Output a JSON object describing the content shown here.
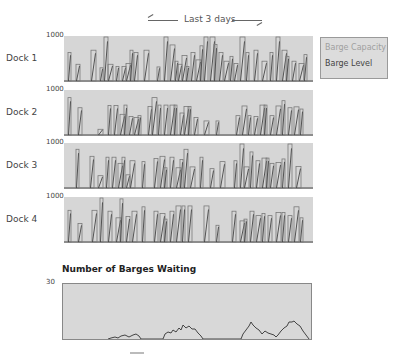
{
  "header": {
    "label": "Last 3 days"
  },
  "legend": {
    "capacity_label": "Barge Capacity",
    "level_label": "Barge Level",
    "capacity_color": "#a0a0a0",
    "level_color": "#444444"
  },
  "docks": [
    {
      "label": "Dock 1",
      "ymax": "1000"
    },
    {
      "label": "Dock 2",
      "ymax": "1000"
    },
    {
      "label": "Dock 3",
      "ymax": "1000"
    },
    {
      "label": "Dock 4",
      "ymax": "1000"
    }
  ],
  "waiting": {
    "title": "Number of Barges Waiting",
    "ymax": "30"
  },
  "chart_data": [
    {
      "type": "bar",
      "title": "Dock 1",
      "subtitle": "Barge Capacity / Barge Level over Last 3 days",
      "ylim": [
        0,
        1000
      ],
      "series": [
        {
          "name": "Barge Capacity",
          "x": [
            4,
            12,
            27,
            36,
            40,
            44,
            52,
            58,
            62,
            66,
            70,
            80,
            93,
            100,
            106,
            111,
            114,
            118,
            122,
            127,
            132,
            136,
            140,
            146,
            150,
            155,
            160,
            166,
            170,
            176,
            182,
            190,
            198,
            206,
            212,
            218,
            222,
            228,
            235,
            240
          ],
          "values": [
            650,
            380,
            700,
            300,
            1000,
            380,
            330,
            330,
            400,
            700,
            650,
            700,
            320,
            1000,
            820,
            450,
            380,
            580,
            330,
            650,
            480,
            800,
            1000,
            1000,
            830,
            650,
            450,
            560,
            400,
            1000,
            650,
            700,
            450,
            650,
            1000,
            700,
            560,
            450,
            400,
            600
          ]
        }
      ]
    },
    {
      "type": "bar",
      "title": "Dock 2",
      "ylim": [
        0,
        1000
      ],
      "series": [
        {
          "name": "Barge Capacity",
          "x": [
            4,
            14,
            34,
            44,
            50,
            56,
            60,
            65,
            70,
            74,
            84,
            88,
            94,
            100,
            106,
            110,
            116,
            120,
            124,
            130,
            140,
            152,
            172,
            178,
            184,
            190,
            196,
            200,
            206,
            212,
            218,
            224,
            230,
            236
          ],
          "values": [
            850,
            620,
            130,
            670,
            670,
            470,
            680,
            420,
            400,
            440,
            650,
            850,
            680,
            680,
            680,
            680,
            500,
            650,
            650,
            400,
            320,
            320,
            440,
            660,
            440,
            420,
            680,
            680,
            440,
            660,
            780,
            620,
            640,
            590
          ]
        }
      ]
    },
    {
      "type": "bar",
      "title": "Dock 3",
      "ylim": [
        0,
        1000
      ],
      "series": [
        {
          "name": "Barge Capacity",
          "x": [
            12,
            26,
            34,
            42,
            48,
            54,
            58,
            62,
            66,
            78,
            90,
            96,
            100,
            106,
            112,
            116,
            120,
            126,
            136,
            146,
            156,
            170,
            176,
            180,
            186,
            192,
            198,
            202,
            206,
            212,
            218,
            224,
            232
          ],
          "values": [
            880,
            720,
            280,
            700,
            700,
            560,
            700,
            300,
            620,
            600,
            670,
            720,
            460,
            700,
            460,
            650,
            880,
            480,
            700,
            440,
            600,
            620,
            1000,
            480,
            820,
            620,
            680,
            680,
            560,
            580,
            660,
            1000,
            490
          ]
        }
      ]
    },
    {
      "type": "bar",
      "title": "Dock 4",
      "ylim": [
        0,
        1000
      ],
      "series": [
        {
          "name": "Barge Capacity",
          "x": [
            4,
            14,
            28,
            36,
            44,
            52,
            56,
            62,
            68,
            78,
            90,
            96,
            100,
            106,
            112,
            118,
            124,
            140,
            152,
            168,
            176,
            180,
            186,
            192,
            198,
            204,
            212,
            218,
            224,
            230,
            236
          ],
          "values": [
            720,
            420,
            720,
            1000,
            700,
            550,
            980,
            580,
            700,
            800,
            700,
            650,
            520,
            700,
            820,
            820,
            820,
            820,
            380,
            700,
            480,
            520,
            700,
            600,
            650,
            600,
            670,
            670,
            600,
            800,
            550
          ]
        }
      ]
    },
    {
      "type": "line",
      "title": "Number of Barges Waiting",
      "ylim": [
        0,
        30
      ],
      "x": [
        0,
        10,
        20,
        30,
        40,
        45,
        50,
        55,
        60,
        70,
        72,
        74,
        76,
        78,
        80,
        85,
        90,
        95,
        100,
        105,
        108,
        110,
        120,
        140,
        160,
        162,
        165,
        168,
        170,
        172,
        175,
        180,
        185,
        190,
        192,
        195,
        198,
        200,
        205,
        210,
        215,
        218,
        220,
        225,
        230,
        240,
        250
      ],
      "values": [
        0,
        0,
        0,
        0,
        0,
        0,
        0,
        1,
        2,
        3,
        4,
        4,
        0,
        0,
        0,
        0,
        0,
        0,
        0,
        0,
        0,
        0,
        0,
        0,
        0,
        0,
        0,
        0,
        0,
        0,
        0,
        0,
        0,
        0,
        0,
        0,
        0,
        0,
        0,
        0,
        0,
        0,
        0,
        0,
        0,
        0,
        0
      ]
    }
  ]
}
